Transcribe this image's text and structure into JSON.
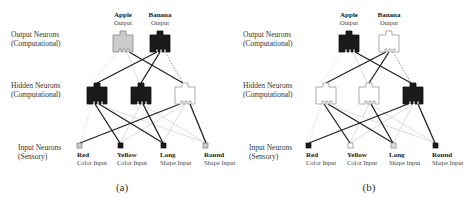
{
  "layer_labels": {
    "output": [
      "Output Neurons",
      "(Computational)"
    ],
    "hidden": [
      "Hidden Neurons",
      "(Computational)"
    ],
    "input": [
      "Input Neurons",
      "(Sensory)"
    ]
  },
  "outputs": [
    {
      "name": "Apple",
      "sub": "Output"
    },
    {
      "name": "Banana",
      "sub": "Output"
    }
  ],
  "inputs": [
    {
      "name": "Red",
      "sub": "Color Input"
    },
    {
      "name": "Yellow",
      "sub": "Color Input"
    },
    {
      "name": "Long",
      "sub": "Shape Input"
    },
    {
      "name": "Round",
      "sub": "Shape Input"
    }
  ],
  "colors": {
    "active": "#1a1a1a",
    "inactive": "#ffffff",
    "partial": "#cccccc",
    "strong_edge": "#222222",
    "weak_edge": "#d0d0d0"
  },
  "panels": [
    {
      "caption": "(a)",
      "output_states": [
        "partial",
        "active"
      ],
      "hidden_states": [
        "active",
        "active",
        "inactive"
      ],
      "input_states": [
        "partial",
        "active",
        "active",
        "partial"
      ]
    },
    {
      "caption": "(b)",
      "output_states": [
        "active",
        "inactive"
      ],
      "hidden_states": [
        "inactive",
        "inactive",
        "active"
      ],
      "input_states": [
        "active",
        "inactive",
        "partial",
        "active"
      ]
    }
  ]
}
